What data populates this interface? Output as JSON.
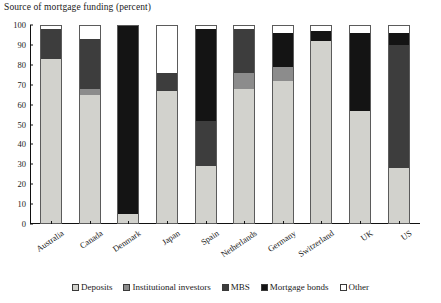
{
  "chart_data": {
    "type": "bar",
    "subtype": "stacked-column-100",
    "title": "Source of mortgage funding (percent)",
    "xlabel": "",
    "ylabel": "",
    "ylim": [
      0,
      100
    ],
    "yticks": [
      0,
      10,
      20,
      30,
      40,
      50,
      60,
      70,
      80,
      90,
      100
    ],
    "grid": false,
    "legend_position": "bottom",
    "categories": [
      "Australia",
      "Canada",
      "Denmark",
      "Japan",
      "Spain",
      "Netherlands",
      "Germany",
      "Switzerland",
      "UK",
      "US"
    ],
    "series": [
      {
        "name": "Deposits",
        "color": "#d2d2cd",
        "values": [
          83,
          65,
          5,
          67,
          29,
          68,
          72,
          92,
          57,
          28
        ]
      },
      {
        "name": "Institutional investors",
        "color": "#8c8c8c",
        "values": [
          0,
          3,
          0,
          0,
          0,
          8,
          7,
          0,
          0,
          0
        ]
      },
      {
        "name": "MBS",
        "color": "#3d3d3d",
        "values": [
          15,
          25,
          0,
          9,
          23,
          22,
          0,
          0,
          0,
          62
        ]
      },
      {
        "name": "Mortgage bonds",
        "color": "#141414",
        "values": [
          0,
          0,
          95,
          0,
          46,
          0,
          17,
          5,
          39,
          6
        ]
      },
      {
        "name": "Other",
        "color": "#ffffff",
        "values": [
          2,
          7,
          0,
          24,
          2,
          2,
          4,
          3,
          4,
          4
        ]
      }
    ]
  },
  "legend": {
    "items": [
      {
        "label": "Deposits",
        "color": "#d2d2cd"
      },
      {
        "label": "Institutional investors",
        "color": "#8c8c8c"
      },
      {
        "label": "MBS",
        "color": "#3d3d3d"
      },
      {
        "label": "Mortgage bonds",
        "color": "#141414"
      },
      {
        "label": "Other",
        "color": "#ffffff"
      }
    ]
  }
}
